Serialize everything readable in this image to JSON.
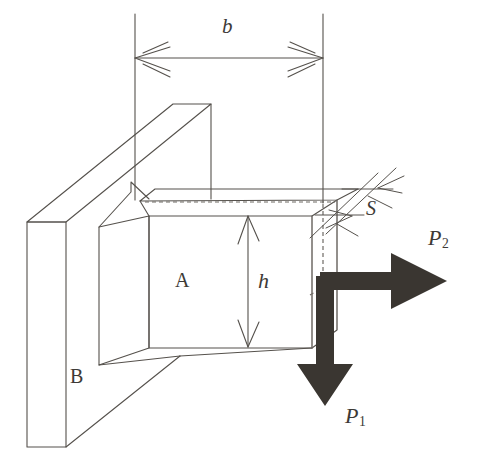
{
  "figure": {
    "kind": "engineering-diagram",
    "background_color": "#ffffff",
    "line_color": "#55514c",
    "arrow_fill_color": "#3a3631",
    "text_color": "#3d3a36",
    "dashed_line_color": "#6e6a65"
  },
  "labels": {
    "width_dimension": "b",
    "height_dimension": "h",
    "thickness_dimension": "S",
    "block": "A",
    "wall": "B",
    "load_horizontal": "P",
    "load_horizontal_sub": "2",
    "load_vertical": "P",
    "load_vertical_sub": "1"
  },
  "geometry": {
    "dimension_b": {
      "x1": 135,
      "x2": 323,
      "y": 58
    },
    "dimension_h": {
      "x": 248,
      "y1": 216,
      "y2": 347
    },
    "dimension_S": {
      "x1": 345,
      "y1": 215,
      "x2": 378,
      "y2": 188
    },
    "block_front_face": {
      "left": 149,
      "right": 312,
      "top": 216,
      "bottom": 348
    },
    "wall_front_face": {
      "left": 27,
      "right": 66,
      "top": 222,
      "bottom": 447
    },
    "load_corner": {
      "x": 325,
      "y": 280
    },
    "load_p2_tip": {
      "x": 447,
      "y": 280
    },
    "load_p1_tip": {
      "x": 325,
      "y": 406
    }
  }
}
